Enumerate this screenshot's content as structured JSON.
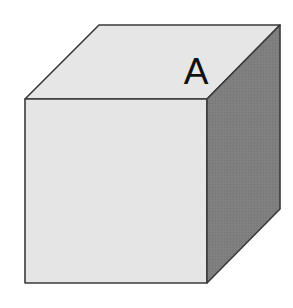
{
  "diagram": {
    "type": "isometric-cube",
    "faces": {
      "top": {
        "label": "A",
        "fill": "#e6e6e6",
        "points": "99,25 280,25 207,99 25,99"
      },
      "front": {
        "label": "",
        "fill": "#e5e5e5",
        "points": "25,99 207,99 207,283 25,283"
      },
      "right": {
        "label": "",
        "fill": "#7e7e7e",
        "points": "207,99 280,25 280,209 207,283"
      }
    },
    "edge_color": "#3a3a3a",
    "background": "#ffffff"
  }
}
